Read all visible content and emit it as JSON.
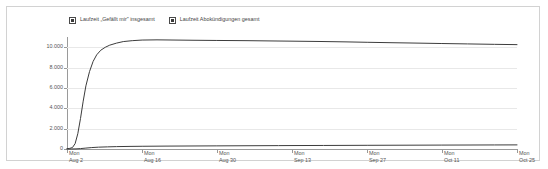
{
  "panel": {
    "background": "#ffffff",
    "border_color": "#d2d2d2"
  },
  "legend": {
    "position": "top-left",
    "items": [
      {
        "label": "Laufzeit „Gefällt mir\" insgesamt",
        "checked": true,
        "checkbox_icon": "checkbox-checked-icon"
      },
      {
        "label": "Laufzeit Abokündigungen gesamt",
        "checked": true,
        "checkbox_icon": "checkbox-checked-icon"
      }
    ]
  },
  "chart_data": {
    "type": "line",
    "title": "",
    "subtitle": "",
    "xlabel": "",
    "ylabel": "",
    "grid": true,
    "legend_position": "top-left",
    "ylim": [
      0,
      11000
    ],
    "yticks": [
      0,
      2000,
      4000,
      6000,
      8000,
      10000
    ],
    "ytick_labels": [
      "0",
      "2.000",
      "4.000",
      "6.000",
      "8.000",
      "10.000"
    ],
    "xticks": [
      {
        "weekday": "Mon",
        "date": "Aug 2",
        "pos": 0.0
      },
      {
        "weekday": "Mon",
        "date": "Aug 16",
        "pos": 0.1667
      },
      {
        "weekday": "Mon",
        "date": "Aug 30",
        "pos": 0.3333
      },
      {
        "weekday": "Mon",
        "date": "Sep 13",
        "pos": 0.5
      },
      {
        "weekday": "Mon",
        "date": "Sep 27",
        "pos": 0.6667
      },
      {
        "weekday": "Mon",
        "date": "Oct 11",
        "pos": 0.8333
      },
      {
        "weekday": "Mon",
        "date": "Oct 25",
        "pos": 1.0
      }
    ],
    "x_range": [
      "Aug 2",
      "Nov 1"
    ],
    "line_color": "#3c3c3c",
    "series": [
      {
        "name": "Laufzeit „Gefällt mir\" insgesamt",
        "color": "#3c3c3c",
        "x": [
          0,
          0.006,
          0.012,
          0.018,
          0.024,
          0.03,
          0.036,
          0.042,
          0.05,
          0.058,
          0.066,
          0.075,
          0.085,
          0.095,
          0.11,
          0.125,
          0.145,
          0.167,
          0.2,
          0.24,
          0.28,
          0.333,
          0.4,
          0.46,
          0.5,
          0.56,
          0.62,
          0.667,
          0.72,
          0.78,
          0.833,
          0.89,
          0.95,
          1.0
        ],
        "values": [
          30,
          60,
          140,
          520,
          1500,
          3000,
          4700,
          6200,
          7600,
          8600,
          9250,
          9700,
          9990,
          10200,
          10400,
          10550,
          10640,
          10700,
          10720,
          10700,
          10680,
          10660,
          10640,
          10610,
          10590,
          10560,
          10520,
          10480,
          10440,
          10400,
          10360,
          10320,
          10280,
          10250
        ]
      },
      {
        "name": "Laufzeit Abokündigungen gesamt",
        "color": "#3c3c3c",
        "x": [
          0,
          0.01,
          0.02,
          0.03,
          0.042,
          0.055,
          0.07,
          0.09,
          0.11,
          0.14,
          0.167,
          0.22,
          0.28,
          0.333,
          0.4,
          0.47,
          0.5,
          0.57,
          0.64,
          0.667,
          0.74,
          0.8,
          0.833,
          0.9,
          0.95,
          1.0
        ],
        "values": [
          2,
          6,
          14,
          40,
          90,
          140,
          180,
          210,
          235,
          255,
          268,
          285,
          298,
          308,
          320,
          332,
          338,
          348,
          358,
          362,
          372,
          380,
          385,
          393,
          398,
          404
        ]
      }
    ]
  }
}
